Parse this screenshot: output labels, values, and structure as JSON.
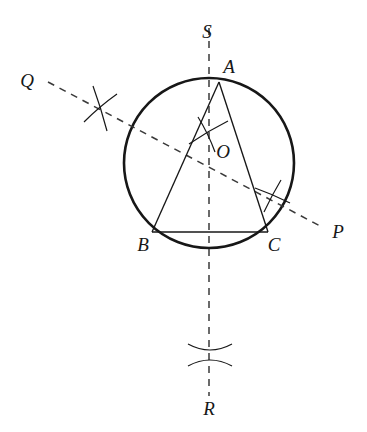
{
  "figure": {
    "background_color": "#ffffff",
    "ink_color": "#171717",
    "canvas": {
      "width": 367,
      "height": 432
    }
  },
  "labels": {
    "S": "S",
    "A": "A",
    "Q": "Q",
    "O": "O",
    "P": "P",
    "B": "B",
    "C": "C",
    "R": "R"
  },
  "label_positions": {
    "S": {
      "x": 207,
      "y": 38
    },
    "A": {
      "x": 229,
      "y": 73
    },
    "Q": {
      "x": 27,
      "y": 87
    },
    "O": {
      "x": 221,
      "y": 158
    },
    "P": {
      "x": 334,
      "y": 238
    },
    "B": {
      "x": 139,
      "y": 251
    },
    "C": {
      "x": 268,
      "y": 251
    },
    "R": {
      "x": 203,
      "y": 415
    }
  },
  "geometry": {
    "circle": {
      "cx": 209,
      "cy": 163,
      "r": 85,
      "stroke_width": 2.6
    },
    "vertices": {
      "A": {
        "x": 219,
        "y": 82
      },
      "B": {
        "x": 152,
        "y": 232
      },
      "C": {
        "x": 268,
        "y": 232
      }
    },
    "centre": {
      "x": 209,
      "y": 163
    },
    "triangle_stroke_width": 1.3,
    "bisector_AB": {
      "name": "perpendicular-bisector-QP",
      "from": {
        "x": 48,
        "y": 82
      },
      "to": {
        "x": 322,
        "y": 227
      },
      "dash": "7 6",
      "stroke_width": 1.5
    },
    "bisector_AC": {
      "name": "perpendicular-bisector-SR",
      "from": {
        "x": 209,
        "y": 28
      },
      "to": {
        "x": 209,
        "y": 396
      },
      "dash": "7 6",
      "stroke_width": 1.5
    },
    "arc_marks": [
      {
        "name": "arc-mark-upper-left",
        "cx": 100,
        "cy": 108,
        "size": 22
      },
      {
        "name": "arc-mark-centre",
        "cx": 208,
        "cy": 133,
        "size": 20
      },
      {
        "name": "arc-mark-lower-right",
        "cx": 272,
        "cy": 196,
        "size": 20
      },
      {
        "name": "arc-mark-bottom",
        "cx": 210,
        "cy": 355,
        "size": 22
      }
    ]
  }
}
